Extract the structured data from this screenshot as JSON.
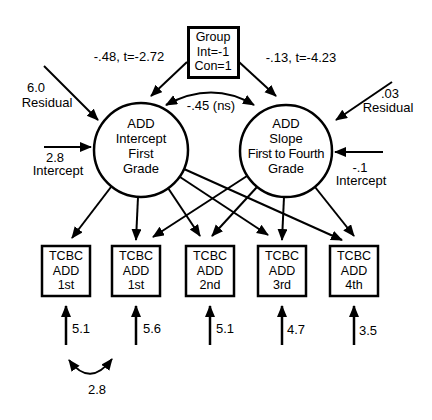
{
  "diagram": {
    "background": "#ffffff",
    "stroke_color": "#000000",
    "group_node": {
      "lines": [
        "Group",
        "Int=-1",
        "Con=1"
      ]
    },
    "paths": {
      "group_to_intercept": "-.48, t=-2.72",
      "group_to_slope": "-.13, t=-4.23",
      "intercept_slope_covariance": "-.45 (ns)"
    },
    "latent_nodes": {
      "intercept": {
        "lines": [
          "ADD",
          "Intercept",
          "First",
          "Grade"
        ]
      },
      "slope": {
        "lines": [
          "ADD",
          "Slope",
          "First to Fourth",
          "Grade"
        ]
      }
    },
    "exogenous": {
      "intercept_residual": {
        "value": "6.0",
        "label": "Residual"
      },
      "intercept_mean": {
        "value": "2.8",
        "label": "Intercept"
      },
      "slope_residual": {
        "value": ".03",
        "label": "Residual"
      },
      "slope_mean": {
        "value": "-.1",
        "label": "Intercept"
      }
    },
    "indicators": [
      {
        "lines": [
          "TCBC",
          "ADD",
          "1st"
        ],
        "residual_variance": "5.1"
      },
      {
        "lines": [
          "TCBC",
          "ADD",
          "1st"
        ],
        "residual_variance": "5.6"
      },
      {
        "lines": [
          "TCBC",
          "ADD",
          "2nd"
        ],
        "residual_variance": "5.1"
      },
      {
        "lines": [
          "TCBC",
          "ADD",
          "3rd"
        ],
        "residual_variance": "4.7"
      },
      {
        "lines": [
          "TCBC",
          "ADD",
          "4th"
        ],
        "residual_variance": "3.5"
      }
    ],
    "indicator_residual_covariance": "2.8"
  }
}
